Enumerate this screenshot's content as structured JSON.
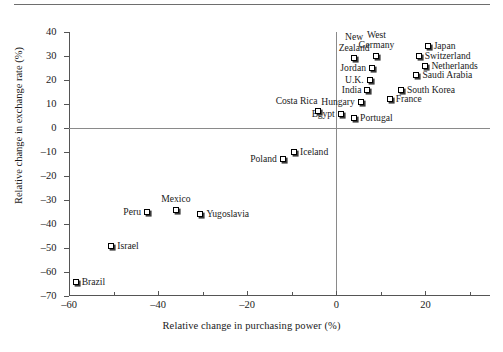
{
  "chart_data": {
    "type": "scatter",
    "title": "",
    "xlabel": "Relative change in purchasing power (%)",
    "ylabel": "Relative change in exchange rate (%)",
    "xlim": [
      -60,
      34.5
    ],
    "ylim": [
      -70,
      40
    ],
    "xticks_major": [
      -60,
      -40,
      -20,
      0,
      20
    ],
    "xticks_minor": [
      -50,
      -30,
      -10,
      10,
      30
    ],
    "yticks": [
      40,
      30,
      20,
      10,
      0,
      -10,
      -20,
      -30,
      -40,
      -50,
      -60,
      -70
    ],
    "xtick_labels": [
      "–60",
      "–40",
      "–20",
      "0",
      "20"
    ],
    "ytick_labels": [
      "40",
      "30",
      "20",
      "10",
      "0",
      "–10",
      "–20",
      "–30",
      "–40",
      "–50",
      "–60",
      "–70"
    ],
    "grid": false,
    "legend": "none",
    "reference_lines": [
      {
        "axis": "y",
        "value": 0
      },
      {
        "axis": "x",
        "value": 0
      }
    ],
    "points": [
      {
        "label": "Japan",
        "x": 20.5,
        "y": 34,
        "pos": "r"
      },
      {
        "label": "Switzerland",
        "x": 18.5,
        "y": 30,
        "pos": "r"
      },
      {
        "label": "Netherlands",
        "x": 20.0,
        "y": 26,
        "pos": "r"
      },
      {
        "label": "Saudi Arabia",
        "x": 18.0,
        "y": 22,
        "pos": "r"
      },
      {
        "label": "South Korea",
        "x": 14.5,
        "y": 16,
        "pos": "r"
      },
      {
        "label": "France",
        "x": 12.0,
        "y": 12,
        "pos": "r"
      },
      {
        "label": "West\nGermany",
        "x": 9.0,
        "y": 30,
        "pos": "t"
      },
      {
        "label": "New\nZealand",
        "x": 4.0,
        "y": 29,
        "pos": "t"
      },
      {
        "label": "Jordan",
        "x": 8.0,
        "y": 25,
        "pos": "l"
      },
      {
        "label": "U.K.",
        "x": 7.5,
        "y": 20,
        "pos": "l"
      },
      {
        "label": "India",
        "x": 7.0,
        "y": 16,
        "pos": "l"
      },
      {
        "label": "Hungary",
        "x": 5.5,
        "y": 11,
        "pos": "l"
      },
      {
        "label": "Egypt",
        "x": 1.0,
        "y": 6,
        "pos": "l"
      },
      {
        "label": "Portugal",
        "x": 4.0,
        "y": 4,
        "pos": "r"
      },
      {
        "label": "Costa Rica",
        "x": -4.0,
        "y": 7,
        "pos": "tl"
      },
      {
        "label": "Iceland",
        "x": -9.5,
        "y": -10,
        "pos": "r"
      },
      {
        "label": "Poland",
        "x": -12.0,
        "y": -13,
        "pos": "l"
      },
      {
        "label": "Yugoslavia",
        "x": -30.5,
        "y": -36,
        "pos": "r"
      },
      {
        "label": "Mexico",
        "x": -36.0,
        "y": -34,
        "pos": "t"
      },
      {
        "label": "Peru",
        "x": -42.5,
        "y": -35,
        "pos": "l"
      },
      {
        "label": "Israel",
        "x": -50.5,
        "y": -49,
        "pos": "r"
      },
      {
        "label": "Brazil",
        "x": -58.5,
        "y": -64,
        "pos": "r"
      }
    ]
  }
}
